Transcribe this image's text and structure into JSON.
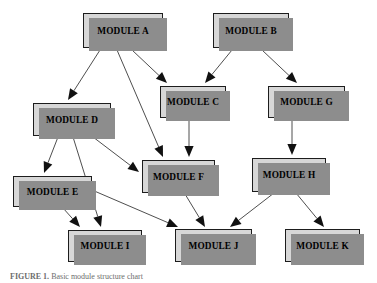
{
  "figure": {
    "background_color": "#ffffff",
    "node_fill_color": "#d7d7d7",
    "node_border_color": "#1d1d1d",
    "node_shadow_color": "#8d8d8d",
    "edge_color": "#3a3a3a",
    "caption_figure_number": "FIGURE 1.",
    "caption_text": "Basic module structure chart"
  },
  "chart_data": {
    "type": "diagram",
    "title": "Basic module structure chart",
    "nodes": [
      {
        "id": "A",
        "label": "MODULE A",
        "x": 83,
        "y": 13,
        "w": 80,
        "h": 35
      },
      {
        "id": "B",
        "label": "MODULE B",
        "x": 213,
        "y": 13,
        "w": 76,
        "h": 35
      },
      {
        "id": "C",
        "label": "MODULE C",
        "x": 160,
        "y": 86,
        "w": 66,
        "h": 32
      },
      {
        "id": "G",
        "label": "MODULE G",
        "x": 268,
        "y": 86,
        "w": 77,
        "h": 32
      },
      {
        "id": "D",
        "label": "MODULE D",
        "x": 33,
        "y": 103,
        "w": 78,
        "h": 33
      },
      {
        "id": "F",
        "label": "MODULE F",
        "x": 142,
        "y": 160,
        "w": 73,
        "h": 33
      },
      {
        "id": "H",
        "label": "MODULE H",
        "x": 252,
        "y": 158,
        "w": 74,
        "h": 34
      },
      {
        "id": "E",
        "label": "MODULE E",
        "x": 13,
        "y": 176,
        "w": 79,
        "h": 31
      },
      {
        "id": "I",
        "label": "MODULE I",
        "x": 68,
        "y": 230,
        "w": 74,
        "h": 32
      },
      {
        "id": "J",
        "label": "MODULE J",
        "x": 175,
        "y": 229,
        "w": 77,
        "h": 33
      },
      {
        "id": "K",
        "label": "MODULE K",
        "x": 285,
        "y": 229,
        "w": 75,
        "h": 33
      }
    ],
    "edges": [
      {
        "from": "A",
        "to": "D",
        "x1": 100,
        "y1": 50,
        "x2": 68,
        "y2": 100
      },
      {
        "from": "A",
        "to": "C",
        "x1": 132,
        "y1": 50,
        "x2": 167,
        "y2": 83
      },
      {
        "from": "A",
        "to": "F",
        "x1": 117,
        "y1": 50,
        "x2": 163,
        "y2": 157
      },
      {
        "from": "B",
        "to": "C",
        "x1": 232,
        "y1": 50,
        "x2": 205,
        "y2": 83
      },
      {
        "from": "B",
        "to": "G",
        "x1": 262,
        "y1": 50,
        "x2": 297,
        "y2": 83
      },
      {
        "from": "C",
        "to": "F",
        "x1": 189,
        "y1": 118,
        "x2": 189,
        "y2": 157
      },
      {
        "from": "G",
        "to": "H",
        "x1": 292,
        "y1": 118,
        "x2": 292,
        "y2": 155
      },
      {
        "from": "D",
        "to": "E",
        "x1": 58,
        "y1": 137,
        "x2": 44,
        "y2": 173
      },
      {
        "from": "D",
        "to": "I",
        "x1": 73,
        "y1": 137,
        "x2": 101,
        "y2": 227
      },
      {
        "from": "D",
        "to": "F",
        "x1": 93,
        "y1": 137,
        "x2": 139,
        "y2": 172
      },
      {
        "from": "E",
        "to": "I",
        "x1": 63,
        "y1": 208,
        "x2": 80,
        "y2": 227
      },
      {
        "from": "E",
        "to": "J",
        "x1": 92,
        "y1": 190,
        "x2": 178,
        "y2": 227
      },
      {
        "from": "F",
        "to": "J",
        "x1": 185,
        "y1": 194,
        "x2": 205,
        "y2": 227
      },
      {
        "from": "H",
        "to": "J",
        "x1": 274,
        "y1": 193,
        "x2": 230,
        "y2": 227
      },
      {
        "from": "H",
        "to": "K",
        "x1": 296,
        "y1": 193,
        "x2": 324,
        "y2": 227
      }
    ]
  }
}
